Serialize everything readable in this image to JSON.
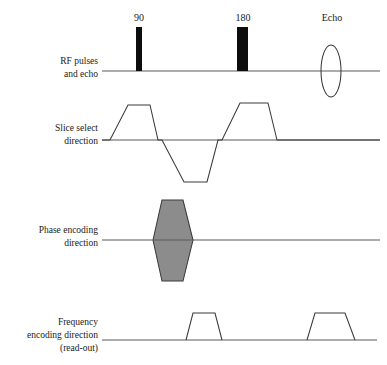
{
  "figure": {
    "type": "timing-diagram",
    "background_color": "#ffffff",
    "line_color": "#3a3a3a",
    "axis_color": "#5a5a5a",
    "fill_gray": "#8c8c8c",
    "fill_black": "#0d0d0d"
  },
  "rows": [
    {
      "id": "rf",
      "label_lines": [
        "RF pulses",
        "and echo"
      ],
      "baseline_y": 71,
      "axis_x_start": 102,
      "axis_x_end": 380
    },
    {
      "id": "slice-select",
      "label_lines": [
        "Slice select",
        "direction"
      ],
      "baseline_y": 140,
      "axis_x_start": 102,
      "axis_x_end": 380
    },
    {
      "id": "phase-encoding",
      "label_lines": [
        "Phase encoding",
        "direction"
      ],
      "baseline_y": 240,
      "axis_x_start": 102,
      "axis_x_end": 380
    },
    {
      "id": "frequency-encoding",
      "label_lines": [
        "Frequency",
        "encoding direction",
        "(read-out)"
      ],
      "baseline_y": 340,
      "axis_x_start": 102,
      "axis_x_end": 377
    }
  ],
  "rf_pulses": [
    {
      "name": "90",
      "label": "90",
      "label_x": 139,
      "label_y": 21,
      "bar_x": 136,
      "bar_width": 6,
      "bar_top": 27,
      "bar_bottom": 71,
      "color": "#0d0d0d"
    },
    {
      "name": "180",
      "label": "180",
      "label_x": 243,
      "label_y": 21,
      "bar_x": 237,
      "bar_width": 11,
      "bar_top": 27,
      "bar_bottom": 71,
      "color": "#0d0d0d"
    }
  ],
  "echo": {
    "label": "Echo",
    "label_x": 332,
    "label_y": 21,
    "center_x": 331,
    "center_y": 71,
    "radius_x": 10,
    "radius_y": 26
  },
  "slice_select_waveform": {
    "points": "102,140 110,140 128,105 150,105 158,140 162,140 184,182 207,182 218,140 222,140 240,103 268,103 277,140 380,140",
    "lobes": [
      {
        "polarity": "positive",
        "role": "slice-selection-gradient",
        "baseline_from": 110,
        "baseline_to": 158,
        "plateau_from": 128,
        "plateau_to": 150,
        "peak_y": 105
      },
      {
        "polarity": "negative",
        "role": "slice-rephasing-lobe",
        "baseline_from": 162,
        "baseline_to": 218,
        "plateau_from": 184,
        "plateau_to": 207,
        "peak_y": 182
      },
      {
        "polarity": "positive",
        "role": "slice-selection-gradient-180",
        "baseline_from": 222,
        "baseline_to": 277,
        "plateau_from": 240,
        "plateau_to": 268,
        "peak_y": 103
      }
    ]
  },
  "phase_encoding_waveform": {
    "shape": "hexagon",
    "fill": "#8c8c8c",
    "points": "153,240 162,200 183,200 193,240 183,281 162,281",
    "baseline_from": 153,
    "baseline_to": 193,
    "top_y": 200,
    "bottom_y": 281
  },
  "frequency_encoding_waveform": {
    "trapezoids": [
      {
        "role": "dephasing-lobe",
        "points": "186,340 193,313 215,313 222,340",
        "baseline_from": 186,
        "baseline_to": 222,
        "plateau_from": 193,
        "plateau_to": 215,
        "peak_y": 313
      },
      {
        "role": "readout-lobe",
        "points": "307,340 315,313 345,313 355,340",
        "baseline_from": 307,
        "baseline_to": 355,
        "plateau_from": 315,
        "plateau_to": 345,
        "peak_y": 313
      }
    ]
  },
  "label_geometry": {
    "label_right_x": 98,
    "rf_label_y": [
      64,
      77
    ],
    "slice_label_y": [
      131,
      144
    ],
    "phase_label_y": [
      233,
      246
    ],
    "frequency_label_y": [
      325,
      338,
      351
    ]
  }
}
